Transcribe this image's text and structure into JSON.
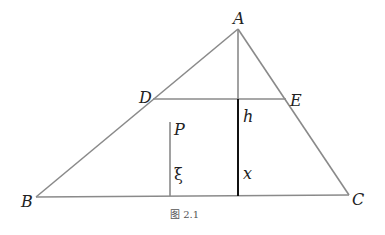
{
  "figure": {
    "caption": "图 2.1",
    "points": {
      "A": {
        "label": "A",
        "x": 238,
        "y": 29
      },
      "B": {
        "label": "B",
        "x": 36,
        "y": 197
      },
      "C": {
        "label": "C",
        "x": 349,
        "y": 195
      },
      "D": {
        "label": "D",
        "x": 153,
        "y": 99
      },
      "E": {
        "label": "E",
        "x": 286,
        "y": 99
      },
      "P": {
        "label": "P"
      }
    },
    "segment_labels": {
      "h": "h",
      "x": "x",
      "xi": "ξ"
    },
    "colors": {
      "triangle_edge": "#8a8a8a",
      "altitude_upper": "#8a8a8a",
      "altitude_lower": "#111111",
      "text": "#222222",
      "caption": "#555555"
    }
  }
}
